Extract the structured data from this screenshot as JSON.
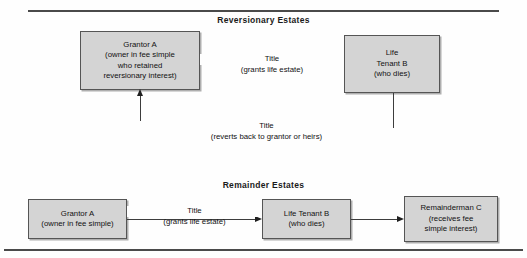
{
  "document": {
    "sections": [
      {
        "id": "reversionary",
        "title": "Reversionary Estates",
        "nodes": [
          {
            "id": "grantor-a-top",
            "name": "Grantor A",
            "lines": [
              "Grantor A",
              "(owner in fee simple",
              "who retained",
              "reversionary interest)"
            ]
          },
          {
            "id": "life-tenant-b-top",
            "name": "Life Tenant B",
            "lines": [
              "Life",
              "Tenant B",
              "(who dies)"
            ]
          }
        ],
        "edges": [
          {
            "id": "grants-life-estate",
            "primary": "Title",
            "secondary": "(grants life estate)",
            "from": "grantor-a-top",
            "to": "life-tenant-b-top"
          },
          {
            "id": "reverts-to-grantor",
            "primary": "Title",
            "secondary": "(reverts back to grantor or heirs)",
            "from": "life-tenant-b-top",
            "to": "grantor-a-top"
          }
        ]
      },
      {
        "id": "remainder",
        "title": "Remainder Estates",
        "nodes": [
          {
            "id": "grantor-a-bottom",
            "name": "Grantor A",
            "lines": [
              "Grantor A",
              "(owner in fee simple)"
            ]
          },
          {
            "id": "life-tenant-b-bottom",
            "name": "Life Tenant B",
            "lines": [
              "Life Tenant B",
              "(who dies)"
            ]
          },
          {
            "id": "remainderman-c",
            "name": "Remainderman C",
            "lines": [
              "Remainderman C",
              "(receives fee",
              "simple interest)"
            ]
          }
        ],
        "edges": [
          {
            "id": "grants-life-estate-2",
            "primary": "Title",
            "secondary": "(grants life estate)",
            "from": "grantor-a-bottom",
            "to": "life-tenant-b-bottom"
          },
          {
            "id": "to-remainderman",
            "primary": "",
            "secondary": "",
            "from": "life-tenant-b-bottom",
            "to": "remainderman-c"
          }
        ]
      }
    ]
  },
  "colors": {
    "box_fill": "#d4d4d4",
    "box_border": "#555555",
    "line": "#3d3d3d",
    "rule": "#4a4a4a",
    "text": "#111111",
    "page_background": "#fefefe"
  }
}
